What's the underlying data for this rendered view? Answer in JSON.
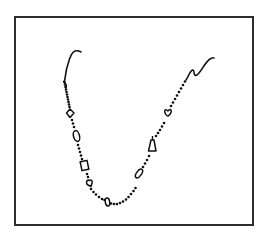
{
  "figure": {
    "frame_color": "#2e2e2e",
    "ink_color": "#111111",
    "charms": [
      {
        "side": "left",
        "shape": "diamond"
      },
      {
        "side": "left",
        "shape": "oval"
      },
      {
        "side": "left",
        "shape": "square"
      },
      {
        "side": "left",
        "shape": "heart"
      },
      {
        "side": "bottom",
        "shape": "oval"
      },
      {
        "side": "right",
        "shape": "oval"
      },
      {
        "side": "right",
        "shape": "bell"
      },
      {
        "side": "right",
        "shape": "heart"
      }
    ],
    "ends": [
      {
        "side": "left",
        "shape": "hook-clasp"
      },
      {
        "side": "right",
        "shape": "wavy-chain-end"
      }
    ]
  }
}
